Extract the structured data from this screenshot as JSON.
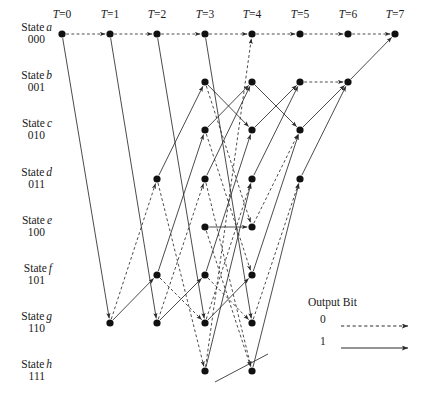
{
  "diagram": {
    "kind": "convolutional-code-trellis",
    "geometry": {
      "width": 426,
      "height": 398,
      "column_x": [
        62,
        110,
        157,
        205,
        252,
        300,
        348,
        395
      ],
      "row_y": [
        34,
        82,
        130,
        179,
        227,
        275,
        323,
        371
      ],
      "node_radius": 3.6
    },
    "time_axis": {
      "labels": [
        "T=0",
        "T=1",
        "T=2",
        "T=3",
        "T=4",
        "T=5",
        "T=6",
        "T=7"
      ],
      "label_y": 16
    },
    "states": [
      {
        "index": 0,
        "word": "State",
        "letter": "a",
        "bits": "000"
      },
      {
        "index": 1,
        "word": "State",
        "letter": "b",
        "bits": "001"
      },
      {
        "index": 2,
        "word": "State",
        "letter": "c",
        "bits": "010"
      },
      {
        "index": 3,
        "word": "State",
        "letter": "d",
        "bits": "011"
      },
      {
        "index": 4,
        "word": "State",
        "letter": "e",
        "bits": "100"
      },
      {
        "index": 5,
        "word": "State",
        "letter": "f",
        "bits": "101"
      },
      {
        "index": 6,
        "word": "State",
        "letter": "g",
        "bits": "110"
      },
      {
        "index": 7,
        "word": "State",
        "letter": "h",
        "bits": "111"
      }
    ],
    "active_nodes": [
      [
        0
      ],
      [
        0,
        6
      ],
      [
        0,
        3,
        5,
        6
      ],
      [
        0,
        1,
        2,
        3,
        4,
        5,
        6,
        7
      ],
      [
        0,
        1,
        2,
        3,
        4,
        5,
        6,
        7
      ],
      [
        0,
        1,
        2,
        3
      ],
      [
        0,
        1
      ],
      [
        0
      ]
    ],
    "edges": [
      {
        "t": 0,
        "from": 0,
        "to": 0,
        "bit": "0"
      },
      {
        "t": 0,
        "from": 0,
        "to": 6,
        "bit": "1"
      },
      {
        "t": 1,
        "from": 0,
        "to": 0,
        "bit": "0"
      },
      {
        "t": 1,
        "from": 0,
        "to": 6,
        "bit": "1"
      },
      {
        "t": 1,
        "from": 6,
        "to": 3,
        "bit": "0"
      },
      {
        "t": 1,
        "from": 6,
        "to": 5,
        "bit": "1"
      },
      {
        "t": 2,
        "from": 0,
        "to": 0,
        "bit": "0"
      },
      {
        "t": 2,
        "from": 0,
        "to": 6,
        "bit": "1"
      },
      {
        "t": 2,
        "from": 3,
        "to": 7,
        "bit": "0"
      },
      {
        "t": 2,
        "from": 3,
        "to": 1,
        "bit": "1"
      },
      {
        "t": 2,
        "from": 5,
        "to": 6,
        "bit": "0"
      },
      {
        "t": 2,
        "from": 5,
        "to": 2,
        "bit": "1"
      },
      {
        "t": 2,
        "from": 6,
        "to": 3,
        "bit": "0"
      },
      {
        "t": 2,
        "from": 6,
        "to": 5,
        "bit": "1"
      },
      {
        "t": 3,
        "from": 0,
        "to": 0,
        "bit": "0"
      },
      {
        "t": 3,
        "from": 0,
        "to": 6,
        "bit": "1"
      },
      {
        "t": 3,
        "from": 1,
        "to": 4,
        "bit": "0"
      },
      {
        "t": 3,
        "from": 1,
        "to": 2,
        "bit": "1"
      },
      {
        "t": 3,
        "from": 2,
        "to": 5,
        "bit": "0"
      },
      {
        "t": 3,
        "from": 2,
        "to": 1,
        "bit": "1"
      },
      {
        "t": 3,
        "from": 3,
        "to": 7,
        "bit": "0"
      },
      {
        "t": 3,
        "from": 3,
        "to": 1,
        "bit": "1"
      },
      {
        "t": 3,
        "from": 4,
        "to": 4,
        "bit": "1"
      },
      {
        "t": 3,
        "from": 4,
        "to": 7,
        "bit": "0"
      },
      {
        "t": 3,
        "from": 5,
        "to": 6,
        "bit": "0"
      },
      {
        "t": 3,
        "from": 5,
        "to": 2,
        "bit": "1"
      },
      {
        "t": 3,
        "from": 6,
        "to": 3,
        "bit": "0"
      },
      {
        "t": 3,
        "from": 6,
        "to": 5,
        "bit": "1"
      },
      {
        "t": 3,
        "from": 7,
        "to": 3,
        "bit": "1"
      },
      {
        "t": 3,
        "from": 7,
        "to": 0,
        "bit": "0"
      },
      {
        "t": 4,
        "from": 0,
        "to": 0,
        "bit": "0"
      },
      {
        "t": 4,
        "from": 1,
        "to": 2,
        "bit": "1"
      },
      {
        "t": 4,
        "from": 2,
        "to": 1,
        "bit": "1"
      },
      {
        "t": 4,
        "from": 3,
        "to": 1,
        "bit": "1"
      },
      {
        "t": 4,
        "from": 4,
        "to": 2,
        "bit": "0"
      },
      {
        "t": 4,
        "from": 5,
        "to": 2,
        "bit": "1"
      },
      {
        "t": 4,
        "from": 6,
        "to": 3,
        "bit": "0"
      },
      {
        "t": 4,
        "from": 7,
        "to": 3,
        "bit": "1"
      },
      {
        "t": 5,
        "from": 0,
        "to": 0,
        "bit": "0"
      },
      {
        "t": 5,
        "from": 1,
        "to": 1,
        "bit": "0"
      },
      {
        "t": 5,
        "from": 2,
        "to": 1,
        "bit": "1"
      },
      {
        "t": 5,
        "from": 3,
        "to": 1,
        "bit": "1"
      },
      {
        "t": 6,
        "from": 0,
        "to": 0,
        "bit": "0"
      },
      {
        "t": 6,
        "from": 1,
        "to": 0,
        "bit": "1"
      }
    ],
    "stray_edges": [
      {
        "x1": 215,
        "y1": 382,
        "x2": 268,
        "y2": 354,
        "bit": "1"
      }
    ],
    "legend": {
      "title": "Output Bit",
      "rows": [
        {
          "key": "0",
          "style": "dashed"
        },
        {
          "key": "1",
          "style": "solid"
        }
      ]
    },
    "colors": {
      "ink": "#1a1a1a",
      "edge": "#2b2b2b",
      "node": "#111111",
      "background": "#ffffff"
    }
  }
}
